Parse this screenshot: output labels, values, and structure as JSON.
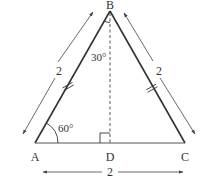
{
  "diagram": {
    "type": "equilateral-triangle-with-altitude",
    "vertices": [
      {
        "id": "A",
        "label": "A",
        "x": 35,
        "y": 143
      },
      {
        "id": "B",
        "label": "B",
        "x": 110,
        "y": 11
      },
      {
        "id": "C",
        "label": "C",
        "x": 185,
        "y": 143
      },
      {
        "id": "D",
        "label": "D",
        "x": 110,
        "y": 143
      }
    ],
    "sides": {
      "AB": {
        "length_label": "2",
        "tick_marks": 2
      },
      "BC": {
        "length_label": "2",
        "tick_marks": 2
      },
      "AC": {
        "length_label": "2"
      }
    },
    "altitude": {
      "from": "B",
      "to": "D",
      "style": "dashed",
      "right_angle_at": "D"
    },
    "angles": {
      "A": {
        "label": "60°"
      },
      "ABD": {
        "label": "30°"
      }
    },
    "colors": {
      "stroke": "#333333",
      "background": "#ffffff"
    }
  }
}
